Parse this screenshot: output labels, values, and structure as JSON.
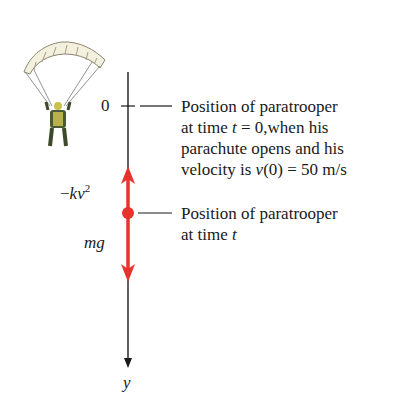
{
  "axis": {
    "label": "y",
    "zero_label": "0"
  },
  "forces": {
    "drag": {
      "prefix": "−",
      "var": "kv",
      "exp": "2"
    },
    "gravity": {
      "label": "mg"
    }
  },
  "annotations": {
    "initial": {
      "lines": [
        "Position of paratrooper",
        "at time ",
        "parachute opens and his",
        "velocity is "
      ],
      "t": "t",
      "eq0": " = 0,when his",
      "v": "v",
      "v0": "(0) = 50 m/s"
    },
    "current": {
      "lines": [
        "Position of paratrooper",
        "at time "
      ],
      "t": "t"
    }
  },
  "colors": {
    "force": "#e8322c",
    "axis": "#1a1a1a"
  }
}
